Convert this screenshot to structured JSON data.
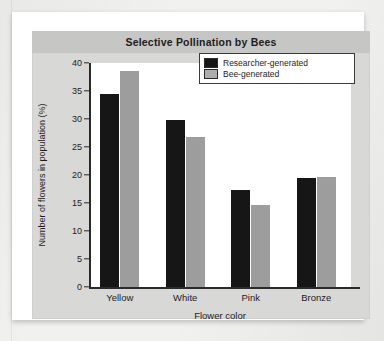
{
  "chart_data": {
    "type": "bar",
    "title": "Selective Pollination by Bees",
    "xlabel": "Flower color",
    "ylabel": "Number of flowers in population (%)",
    "categories": [
      "Yellow",
      "White",
      "Pink",
      "Bronze"
    ],
    "series": [
      {
        "name": "Researcher-generated",
        "color": "#161616",
        "values": [
          34.4,
          29.8,
          17.3,
          19.4
        ]
      },
      {
        "name": "Bee-generated",
        "color": "#9d9d9d",
        "values": [
          38.5,
          26.7,
          14.6,
          19.7
        ]
      }
    ],
    "ylim": [
      0,
      40
    ],
    "yticks": [
      0,
      5,
      10,
      15,
      20,
      25,
      30,
      35,
      40
    ],
    "ytick_labels": [
      "0",
      "5",
      "10",
      "15",
      "20",
      "25",
      "30",
      "35",
      "40"
    ],
    "grid": false,
    "legend_position": "top-right"
  },
  "colors": {
    "page_background": "#f1f1ef",
    "card": "#ffffff",
    "panel": "#d8d8d6",
    "title_band": "#c6c6c4",
    "plot_area": "#ffffff",
    "axis": "#2a2a2a",
    "text": "#1d1d1d"
  }
}
